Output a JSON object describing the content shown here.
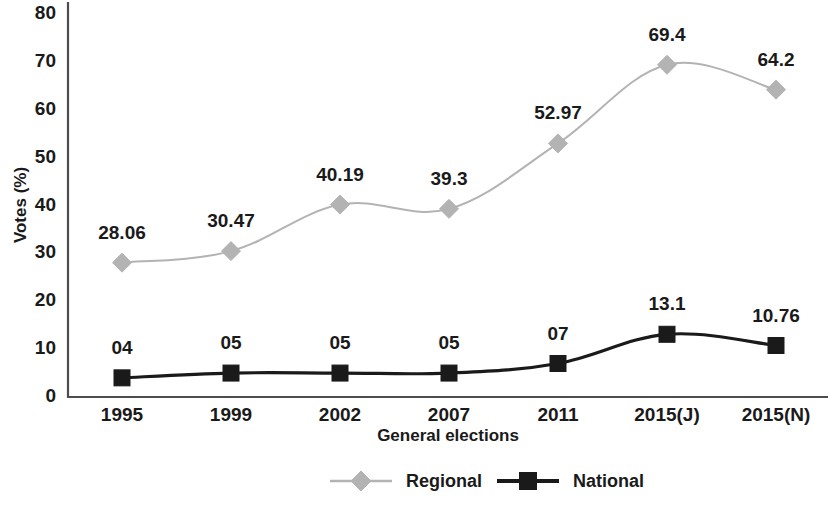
{
  "chart_data": {
    "type": "line",
    "title": "",
    "xlabel": "General elections",
    "ylabel": "Votes (%)",
    "categories": [
      "1995",
      "1999",
      "2002",
      "2007",
      "2011",
      "2015(J)",
      "2015(N)"
    ],
    "ylim": [
      0,
      80
    ],
    "yticks": [
      0,
      10,
      20,
      30,
      40,
      50,
      60,
      70,
      80
    ],
    "grid": false,
    "legend_position": "bottom-center",
    "series": [
      {
        "name": "Regional",
        "color": "#b3b3b3",
        "marker": "diamond",
        "values": [
          28.06,
          30.47,
          40.19,
          39.3,
          52.97,
          69.4,
          64.2
        ],
        "labels": [
          "28.06",
          "30.47",
          "40.19",
          "39.3",
          "52.97",
          "69.4",
          "64.2"
        ]
      },
      {
        "name": "National",
        "color": "#1a1a1a",
        "marker": "square",
        "values": [
          4,
          5,
          5,
          5,
          7,
          13.1,
          10.76
        ],
        "labels": [
          "04",
          "05",
          "05",
          "05",
          "07",
          "13.1",
          "10.76"
        ]
      }
    ]
  },
  "legend": {
    "items": [
      {
        "label": "Regional"
      },
      {
        "label": "National"
      }
    ]
  }
}
